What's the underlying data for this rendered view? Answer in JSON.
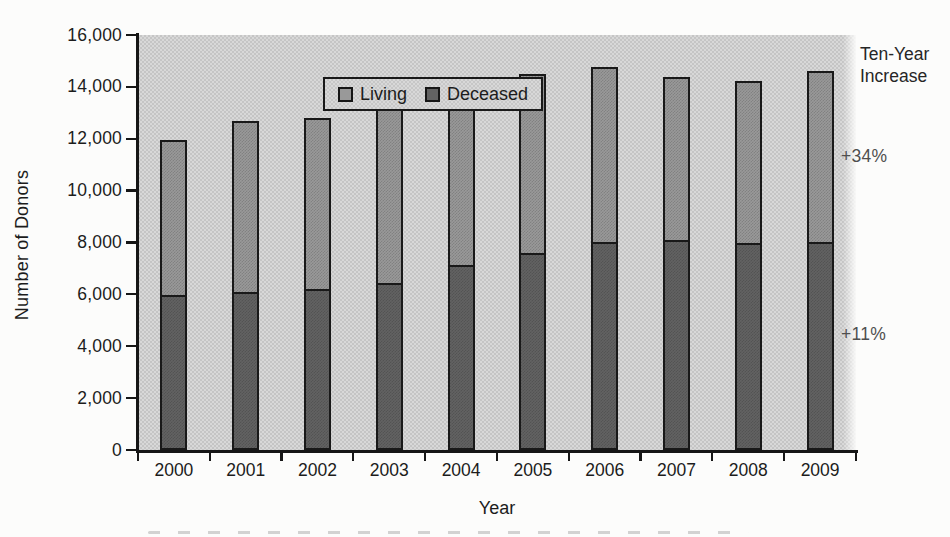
{
  "figure": {
    "y_axis_title": "Number of Donors",
    "x_axis_title": "Year",
    "legend": {
      "items": [
        {
          "label": "Living"
        },
        {
          "label": "Deceased"
        }
      ]
    },
    "right_annotation": {
      "line1": "Ten-Year",
      "line2": "Increase",
      "upper_pct": "+34%",
      "lower_pct": "+11%"
    },
    "colors": {
      "living_fill": "#999999",
      "deceased_fill": "#626262",
      "plot_background": "#d8d8d8",
      "axis": "#161616",
      "pct_text": "#4f4f4f"
    }
  },
  "chart_data": {
    "type": "bar",
    "stacked": true,
    "title": "",
    "xlabel": "Year",
    "ylabel": "Number of Donors",
    "ylim": [
      0,
      16000
    ],
    "grid": false,
    "legend_position": "top-left inside plot area",
    "categories": [
      "2000",
      "2001",
      "2002",
      "2003",
      "2004",
      "2005",
      "2006",
      "2007",
      "2008",
      "2009"
    ],
    "y_ticks": [
      "0",
      "2,000",
      "4,000",
      "6,000",
      "8,000",
      "10,000",
      "12,000",
      "14,000",
      "16,000"
    ],
    "series": [
      {
        "name": "Deceased",
        "stack_position": "bottom",
        "values": [
          5985,
          6080,
          6190,
          6455,
          7150,
          7595,
          8020,
          8085,
          7990,
          8020
        ]
      },
      {
        "name": "Living",
        "stack_position": "top",
        "values": [
          5950,
          6620,
          6620,
          6830,
          7005,
          6895,
          6730,
          6315,
          6220,
          6610
        ]
      }
    ],
    "totals": [
      11935,
      12700,
      12810,
      13285,
      14155,
      14490,
      14750,
      14400,
      14210,
      14630
    ],
    "annotations": [
      {
        "text": "Ten-Year Increase",
        "position": "right of plot, top"
      },
      {
        "text": "+34%",
        "position": "right of plot, beside upper segment"
      },
      {
        "text": "+11%",
        "position": "right of plot, beside lower segment"
      }
    ]
  }
}
